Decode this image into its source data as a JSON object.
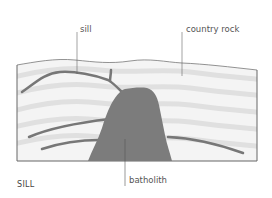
{
  "diagram": {
    "title": "SILL",
    "labels": {
      "sill": "sill",
      "country_rock": "country rock",
      "batholith": "batholith"
    },
    "colors": {
      "background": "#ffffff",
      "rock_fill": "#f2f2f2",
      "rock_bands": "#e2e2e2",
      "intrusion": "#7a7a7a",
      "outline": "#666666",
      "text": "#555555"
    }
  }
}
